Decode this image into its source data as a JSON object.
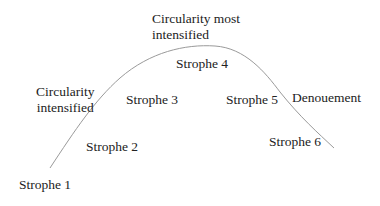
{
  "diagram": {
    "type": "arch-curve",
    "curve_color": "#9a9a9a",
    "text_color": "#222222",
    "labels": {
      "strophe1": "Strophe 1",
      "strophe2": "Strophe 2",
      "strophe3": "Strophe 3",
      "strophe4": "Strophe 4",
      "strophe5": "Strophe 5",
      "strophe6": "Strophe 6",
      "denouement": "Denouement",
      "circularity_intensified_line1": "Circularity",
      "circularity_intensified_line2": "intensified",
      "circularity_most_line1": "Circularity most",
      "circularity_most_line2": "intensified"
    }
  }
}
